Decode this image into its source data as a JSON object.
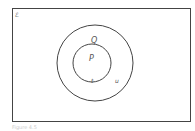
{
  "diagram": {
    "type": "venn",
    "universal_set": {
      "label": "ℰ"
    },
    "sets": [
      {
        "name": "Q",
        "label": "Q",
        "contains": [
          "P",
          "u"
        ]
      },
      {
        "name": "P",
        "label": "P",
        "subset_of": "Q",
        "contains": [
          "t"
        ]
      }
    ],
    "elements": [
      {
        "label": "t",
        "in": "P"
      },
      {
        "label": "u",
        "in": "Q"
      }
    ],
    "colors": {
      "stroke": "#444444",
      "text": "#555555",
      "background": "#ffffff"
    }
  },
  "caption": "Figure 4.5"
}
